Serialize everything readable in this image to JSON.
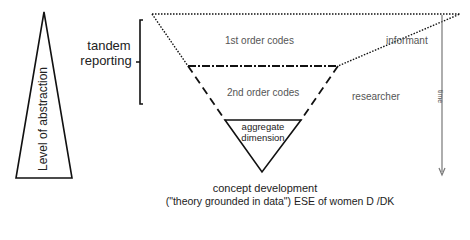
{
  "diagram": {
    "abstraction_label": "Level of abstraction",
    "tandem_label_line1": "tandem",
    "tandem_label_line2": "reporting",
    "first_order": "1st order codes",
    "second_order": "2nd order codes",
    "aggregate_line1": "aggregate",
    "aggregate_line2": "dimension",
    "informant": "informant",
    "researcher": "researcher",
    "time": "time",
    "caption_line1": "concept development",
    "caption_line2": "(\"theory grounded in data\") ESE of women D /DK"
  },
  "colors": {
    "stroke": "#111111",
    "text": "#555555",
    "arrow": "#777777"
  }
}
